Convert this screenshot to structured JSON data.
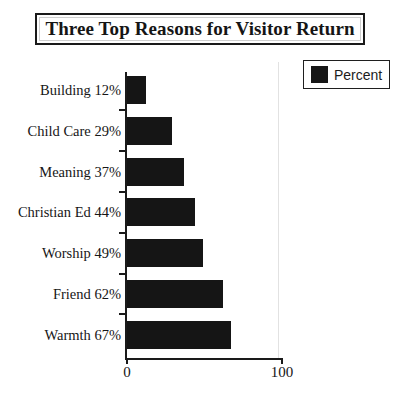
{
  "title": "Three Top Reasons for Visitor Return",
  "legend": {
    "label": "Percent",
    "swatch_color": "#151515"
  },
  "axis": {
    "x_ticks": [
      "0",
      "100"
    ],
    "x_min": 0,
    "x_max": 100
  },
  "chart_data": {
    "type": "bar",
    "orientation": "horizontal",
    "title": "Three Top Reasons for Visitor Return",
    "xlabel": "",
    "ylabel": "",
    "xlim": [
      0,
      100
    ],
    "grid": false,
    "legend_position": "top-right",
    "series": [
      {
        "name": "Percent",
        "color": "#151515",
        "values": [
          12,
          29,
          37,
          44,
          49,
          62,
          67
        ]
      }
    ],
    "categories": [
      "Building",
      "Child Care",
      "Meaning",
      "Christian Ed",
      "Worship",
      "Friend",
      "Warmth"
    ],
    "category_labels": [
      "Building 12%",
      "Child Care 29%",
      "Meaning 37%",
      "Christian Ed 44%",
      "Worship 49%",
      "Friend 62%",
      "Warmth 67%"
    ],
    "tick_labels": [
      "0",
      "100"
    ]
  }
}
